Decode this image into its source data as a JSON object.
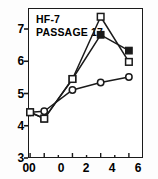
{
  "figure": {
    "title_line1": "HF-7",
    "title_line2": "PASSAGE 17"
  },
  "axes": {
    "y_ticks": [
      "3",
      "4",
      "5",
      "6",
      "7"
    ],
    "x_ticks": [
      "00",
      "0",
      "2",
      "4",
      "6"
    ]
  },
  "chart_data": {
    "type": "line",
    "title": "HF-7 PASSAGE 17",
    "xlabel": "",
    "ylabel": "",
    "xlim": [
      -1.15,
      7.0
    ],
    "ylim": [
      3,
      7.45
    ],
    "grid": false,
    "legend": "none",
    "x_tick_values": [
      -1.0,
      0,
      2,
      4,
      6
    ],
    "x_tick_labels": [
      "00",
      "0",
      "2",
      "4",
      "6"
    ],
    "y_tick_values": [
      3,
      4,
      5,
      6,
      7
    ],
    "y_tick_labels": [
      "3",
      "4",
      "5",
      "6",
      "7"
    ],
    "x": [
      -1.0,
      0,
      2,
      4,
      6
    ],
    "series": [
      {
        "name": "open-circle",
        "marker": "open-circle",
        "color": "#1a1a1a",
        "values": [
          4.42,
          4.45,
          5.11,
          5.34,
          5.51
        ]
      },
      {
        "name": "filled-square",
        "marker": "filled-square",
        "color": "#1a1a1a",
        "values": [
          4.42,
          4.22,
          5.45,
          6.82,
          6.33
        ]
      },
      {
        "name": "open-square",
        "marker": "open-square",
        "color": "#1a1a1a",
        "values": [
          4.42,
          4.22,
          5.45,
          7.38,
          5.98
        ]
      }
    ]
  }
}
